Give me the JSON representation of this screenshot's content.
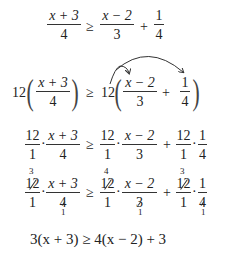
{
  "steps": [
    {
      "lhs": {
        "num": "x + 3",
        "den": "4"
      },
      "rel": "≥",
      "rhs": [
        {
          "num": "x − 2",
          "den": "3"
        },
        {
          "op": "+"
        },
        {
          "num": "1",
          "den": "4"
        }
      ]
    },
    {
      "lhs_coef": "12",
      "lhs": {
        "num": "x + 3",
        "den": "4"
      },
      "rel": "≥",
      "rhs_coef": "12",
      "rhs": [
        {
          "num": "x − 2",
          "den": "3"
        },
        {
          "op": "+"
        },
        {
          "num": "1",
          "den": "4"
        }
      ],
      "annotation": "distribution-arrows"
    },
    {
      "terms": [
        {
          "a": {
            "num": "12",
            "den": "1"
          },
          "b": {
            "num": "x + 3",
            "den": "4"
          }
        },
        {
          "rel": "≥"
        },
        {
          "a": {
            "num": "12",
            "den": "1"
          },
          "b": {
            "num": "x − 2",
            "den": "3"
          }
        },
        {
          "op": "+"
        },
        {
          "a": {
            "num": "12",
            "den": "1"
          },
          "b": {
            "num": "1",
            "den": "4"
          }
        }
      ],
      "dot": "·"
    },
    {
      "terms": [
        {
          "a": {
            "num": "12",
            "den": "1",
            "reduced_num": "3"
          },
          "b": {
            "num": "x + 3",
            "den": "4",
            "reduced_den": "1"
          }
        },
        {
          "rel": "≥"
        },
        {
          "a": {
            "num": "12",
            "den": "1",
            "reduced_num": "4"
          },
          "b": {
            "num": "x − 2",
            "den": "3",
            "reduced_den": "1"
          }
        },
        {
          "op": "+"
        },
        {
          "a": {
            "num": "12",
            "den": "1",
            "reduced_num": "3"
          },
          "b": {
            "num": "1",
            "den": "4",
            "reduced_den": "1"
          }
        }
      ],
      "dot": "·"
    },
    {
      "text": "3(x + 3) ≥ 4(x − 2) + 3"
    }
  ]
}
